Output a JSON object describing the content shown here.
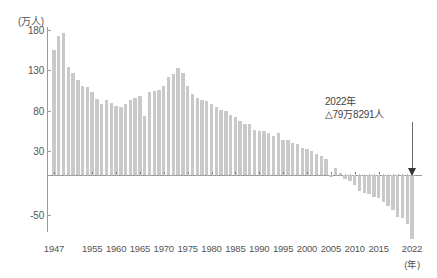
{
  "chart_data": {
    "type": "bar",
    "title": "",
    "subtitle": "",
    "xlabel": "(年)",
    "ylabel": "(万人)",
    "unit_label": "(万人)",
    "ylim": [
      -80,
      180
    ],
    "y_ticks": [
      180,
      130,
      80,
      30,
      -50
    ],
    "y_tick_labels": [
      "180",
      "130",
      "80",
      "30",
      "-50"
    ],
    "grid": false,
    "legend": null,
    "x_tick_labels": [
      "1947",
      "1955",
      "1960",
      "1965",
      "1970",
      "1975",
      "1980",
      "1985",
      "1990",
      "1995",
      "2000",
      "2005",
      "2010",
      "2015",
      "2022"
    ],
    "x_unit": "(年)",
    "categories": [
      1947,
      1948,
      1949,
      1950,
      1951,
      1952,
      1953,
      1954,
      1955,
      1956,
      1957,
      1958,
      1959,
      1960,
      1961,
      1962,
      1963,
      1964,
      1965,
      1966,
      1967,
      1968,
      1969,
      1970,
      1971,
      1972,
      1973,
      1974,
      1975,
      1976,
      1977,
      1978,
      1979,
      1980,
      1981,
      1982,
      1983,
      1984,
      1985,
      1986,
      1987,
      1988,
      1989,
      1990,
      1991,
      1992,
      1993,
      1994,
      1995,
      1996,
      1997,
      1998,
      1999,
      2000,
      2001,
      2002,
      2003,
      2004,
      2005,
      2006,
      2007,
      2008,
      2009,
      2010,
      2011,
      2012,
      2013,
      2014,
      2015,
      2016,
      2017,
      2018,
      2019,
      2020,
      2021,
      2022
    ],
    "values": [
      155,
      173,
      176,
      134,
      127,
      118,
      111,
      109,
      103,
      94,
      88,
      93,
      89,
      86,
      85,
      88,
      93,
      96,
      98,
      73,
      103,
      104,
      106,
      110,
      122,
      126,
      133,
      127,
      110,
      100,
      95,
      93,
      92,
      88,
      84,
      81,
      79,
      75,
      72,
      67,
      63,
      63,
      56,
      55,
      55,
      52,
      48,
      52,
      44,
      43,
      40,
      38,
      33,
      32,
      30,
      26,
      23,
      20,
      -2,
      9,
      2,
      -5,
      -7,
      -13,
      -20,
      -22,
      -24,
      -27,
      -29,
      -33,
      -39,
      -44,
      -52,
      -53,
      -61,
      -80
    ],
    "highlight": {
      "year": 2022,
      "label_line1": "2022年",
      "label_line2": "△79万8291人",
      "value": -79.8291
    },
    "bar_color": "#c9c9c9",
    "axis_color": "#9a9a9a",
    "text_color": "#555555"
  }
}
